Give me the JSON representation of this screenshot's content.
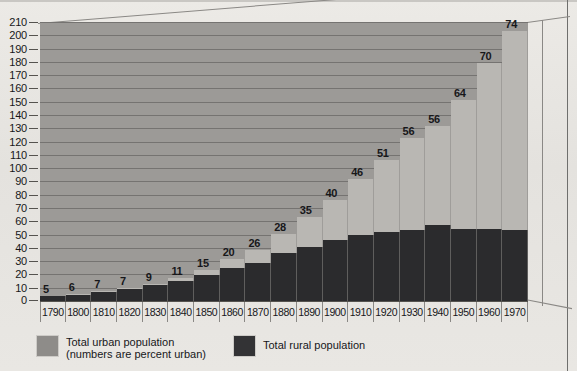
{
  "chart_data": {
    "type": "bar",
    "title": "",
    "xlabel": "",
    "ylabel": "",
    "ylim": [
      0,
      210
    ],
    "ytick_step": 10,
    "grid": true,
    "stacked": true,
    "legend_position": "bottom-left",
    "categories": [
      "1790",
      "1800",
      "1810",
      "1820",
      "1830",
      "1840",
      "1850",
      "1860",
      "1870",
      "1880",
      "1890",
      "1900",
      "1910",
      "1920",
      "1930",
      "1940",
      "1950",
      "1960",
      "1970"
    ],
    "yticks": [
      "0",
      "10",
      "20",
      "30",
      "40",
      "50",
      "60",
      "70",
      "80",
      "90",
      "100",
      "110",
      "120",
      "130",
      "140",
      "150",
      "160",
      "170",
      "180",
      "190",
      "200",
      "210"
    ],
    "series": [
      {
        "name": "Total urban population",
        "color": "#b9b7b3",
        "values": [
          0.2,
          0.3,
          0.5,
          0.7,
          1.1,
          1.8,
          3.5,
          6.2,
          9.9,
          14.1,
          22.1,
          30.2,
          42.0,
          54.2,
          69.0,
          74.4,
          96.5,
          125.3,
          149.3
        ]
      },
      {
        "name": "Total rural population",
        "color": "#2b2b2d",
        "values": [
          3.7,
          4.9,
          6.7,
          8.9,
          11.7,
          15.2,
          19.6,
          25.2,
          28.7,
          36.0,
          40.8,
          45.8,
          50.0,
          51.6,
          53.8,
          57.2,
          54.5,
          54.1,
          53.6
        ]
      }
    ],
    "point_labels": {
      "note": "numbers are percent urban",
      "values": [
        5,
        6,
        7,
        7,
        9,
        11,
        15,
        20,
        26,
        28,
        35,
        40,
        46,
        51,
        56,
        56,
        64,
        70,
        74
      ]
    },
    "totals": [
      3.9,
      5.2,
      7.2,
      9.6,
      12.8,
      17.0,
      23.1,
      31.4,
      38.6,
      50.1,
      62.9,
      76.0,
      92.0,
      105.8,
      122.8,
      131.6,
      151.0,
      179.4,
      202.9
    ]
  },
  "legend": {
    "items": [
      {
        "label_line1": "Total urban population",
        "label_line2": "(numbers are percent urban)",
        "swatch": "urban"
      },
      {
        "label_line1": "Total rural population",
        "label_line2": "",
        "swatch": "rural"
      }
    ]
  },
  "colors": {
    "plot_background": "#9c9a97",
    "urban": "#b9b7b3",
    "rural": "#2b2b2d",
    "page_background": "#e6e5e1",
    "gridline": "#6e6c6a",
    "text": "#17171a"
  }
}
